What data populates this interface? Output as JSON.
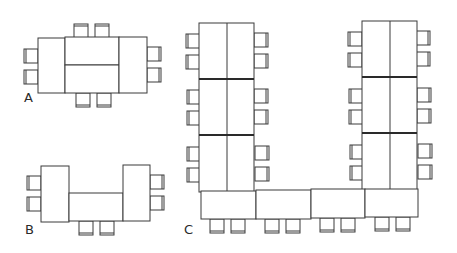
{
  "diagram": {
    "title": "",
    "type": "table-seating-layouts",
    "layouts": [
      {
        "id": "A",
        "label": "A",
        "description": "Boardroom: two end tables plus two center tables, 8 chairs"
      },
      {
        "id": "B",
        "label": "B",
        "description": "U-shape (short): two end tables and one center table, 6 chairs"
      },
      {
        "id": "C",
        "label": "C",
        "description": "U-shape (long): two columns of 3 double-tables joined by a bottom row of 4 tables, 18 chairs"
      }
    ],
    "colors": {
      "line": "#3a3a3a",
      "background": "#ffffff",
      "text": "#2a2a2a"
    }
  },
  "labels": {
    "a": "A",
    "b": "B",
    "c": "C"
  }
}
